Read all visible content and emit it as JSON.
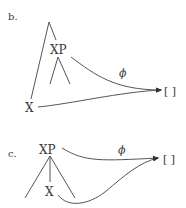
{
  "panels": [
    {
      "id": "b",
      "label": "b.",
      "upper_node": "XP",
      "lower_node": "X",
      "arrow_label": "ϕ",
      "target": "[ ]"
    },
    {
      "id": "c",
      "label": "c.",
      "upper_node": "XP",
      "lower_node": "X",
      "arrow_label": "ϕ",
      "target": "[ ]"
    }
  ],
  "colors": {
    "ink": "#3a3a3a",
    "line": "#555555",
    "background": "#ffffff"
  }
}
